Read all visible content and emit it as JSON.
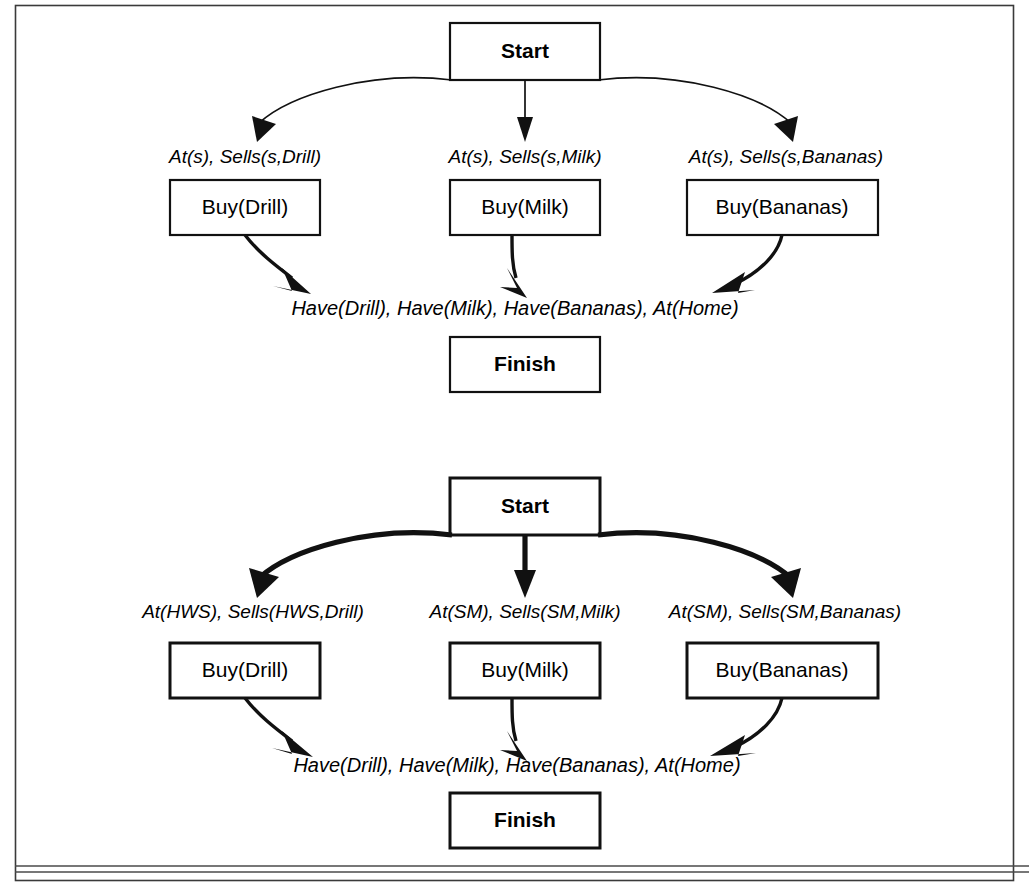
{
  "figure": {
    "background_color": "#ffffff",
    "frame_color": "#3a3a3a",
    "line_color": "#111111"
  },
  "plans": [
    {
      "id": "abstract-plan",
      "line_weight": "thin",
      "start": {
        "label": "Start"
      },
      "finish": {
        "label": "Finish"
      },
      "goal_condition": "Have(Drill), Have(Milk), Have(Bananas), At(Home)",
      "steps": [
        {
          "precondition": "At(s), Sells(s,Drill)",
          "action": "Buy(Drill)"
        },
        {
          "precondition": "At(s), Sells(s,Milk)",
          "action": "Buy(Milk)"
        },
        {
          "precondition": "At(s), Sells(s,Bananas)",
          "action": "Buy(Bananas)"
        }
      ]
    },
    {
      "id": "instantiated-plan",
      "line_weight": "thick",
      "start": {
        "label": "Start"
      },
      "finish": {
        "label": "Finish"
      },
      "goal_condition": "Have(Drill), Have(Milk), Have(Bananas), At(Home)",
      "steps": [
        {
          "precondition": "At(HWS), Sells(HWS,Drill)",
          "action": "Buy(Drill)"
        },
        {
          "precondition": "At(SM), Sells(SM,Milk)",
          "action": "Buy(Milk)"
        },
        {
          "precondition": "At(SM), Sells(SM,Bananas)",
          "action": "Buy(Bananas)"
        }
      ]
    }
  ]
}
